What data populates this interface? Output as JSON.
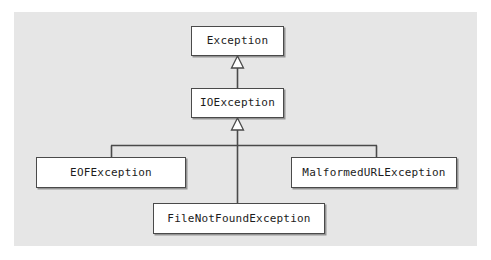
{
  "diagram": {
    "type": "uml-class-diagram",
    "background_color": "#e6e6e6",
    "node_fill_color": "#ffffff",
    "line_color": "#4a4a4a",
    "text_color": "#1c1c1c",
    "nodes": [
      {
        "id": "exception",
        "label": "Exception"
      },
      {
        "id": "ioexception",
        "label": "IOException"
      },
      {
        "id": "eofexception",
        "label": "EOFException"
      },
      {
        "id": "malformedurlexception",
        "label": "MalformedURLException"
      },
      {
        "id": "filenotfoundexception",
        "label": "FileNotFoundException"
      }
    ],
    "relationships": [
      {
        "type": "generalization",
        "from": "IOException",
        "to": "Exception"
      },
      {
        "type": "generalization",
        "from": "EOFException",
        "to": "IOException"
      },
      {
        "type": "generalization",
        "from": "FileNotFoundException",
        "to": "IOException"
      },
      {
        "type": "generalization",
        "from": "MalformedURLException",
        "to": "IOException"
      }
    ]
  }
}
